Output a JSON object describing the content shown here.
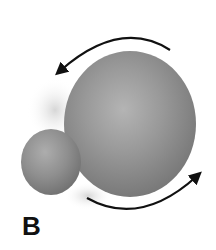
{
  "figure": {
    "panel_label": "B",
    "objects": [
      {
        "name": "large-sphere",
        "cx": 130,
        "cy": 124,
        "rx": 66,
        "ry": 73,
        "color": "#8c8c8c"
      },
      {
        "name": "small-sphere",
        "cx": 51,
        "cy": 162,
        "rx": 30,
        "ry": 33,
        "color": "#8a8a8a"
      }
    ],
    "arrows": [
      {
        "name": "top-rotation-arrow",
        "direction": "counter-clockwise",
        "color": "#111111"
      },
      {
        "name": "bottom-rotation-arrow",
        "direction": "counter-clockwise",
        "color": "#111111"
      }
    ]
  }
}
